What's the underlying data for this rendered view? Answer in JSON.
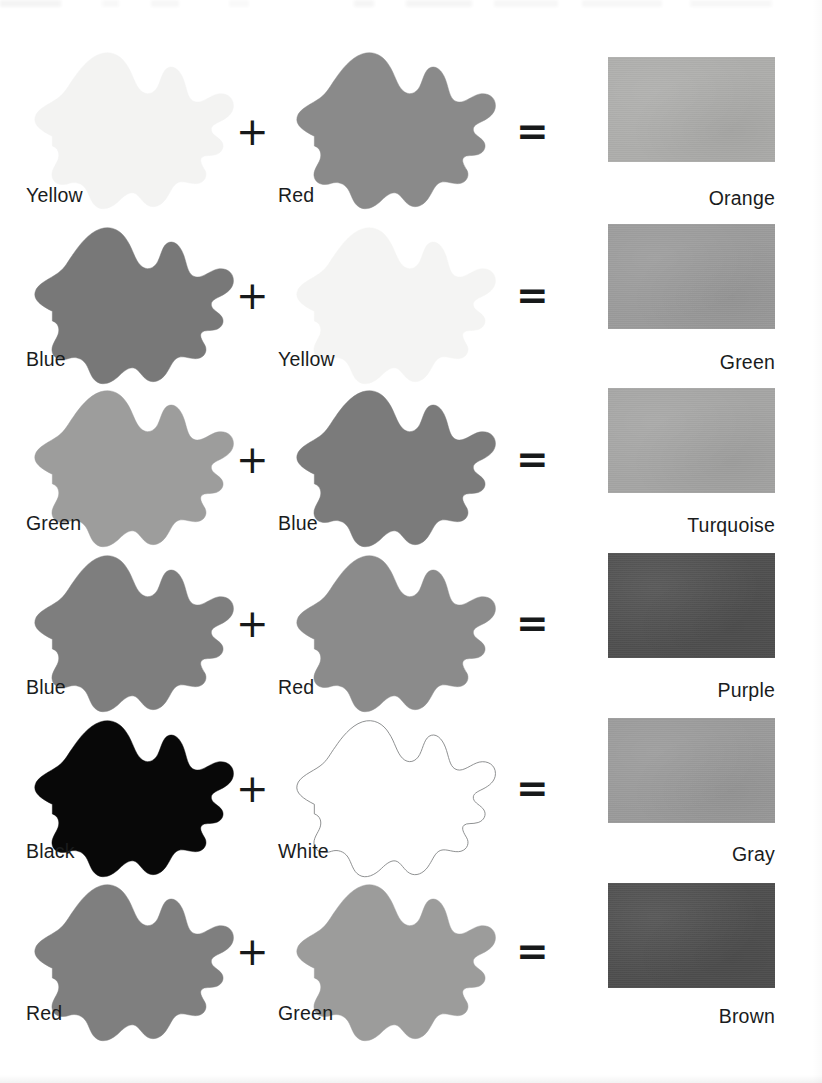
{
  "document": {
    "title": "Color Mixing Chart",
    "operators": {
      "plus": "+",
      "equals": "="
    },
    "swatch_texture_note": "grayscale scan"
  },
  "rows": [
    {
      "id": "row-orange",
      "ingredient_a": {
        "label": "Yellow",
        "swatch_color": "#f3f3f2"
      },
      "ingredient_b": {
        "label": "Red",
        "swatch_color": "#8a8a8a"
      },
      "result": {
        "label": "Orange",
        "swatch_color": "#adadab"
      }
    },
    {
      "id": "row-green",
      "ingredient_a": {
        "label": "Blue",
        "swatch_color": "#787878"
      },
      "ingredient_b": {
        "label": "Yellow",
        "swatch_color": "#f4f4f3"
      },
      "result": {
        "label": "Green",
        "swatch_color": "#9b9b9b"
      }
    },
    {
      "id": "row-turquoise",
      "ingredient_a": {
        "label": "Green",
        "swatch_color": "#9d9d9c"
      },
      "ingredient_b": {
        "label": "Blue",
        "swatch_color": "#7b7b7b"
      },
      "result": {
        "label": "Turquoise",
        "swatch_color": "#a5a5a4"
      }
    },
    {
      "id": "row-purple",
      "ingredient_a": {
        "label": "Blue",
        "swatch_color": "#7e7e7e"
      },
      "ingredient_b": {
        "label": "Red",
        "swatch_color": "#8b8b8b"
      },
      "result": {
        "label": "Purple",
        "swatch_color": "#4f4f4f"
      }
    },
    {
      "id": "row-gray",
      "ingredient_a": {
        "label": "Black",
        "swatch_color": "#080808"
      },
      "ingredient_b": {
        "label": "White",
        "swatch_color": "#ffffff"
      },
      "result": {
        "label": "Gray",
        "swatch_color": "#9a9a9a"
      }
    },
    {
      "id": "row-brown",
      "ingredient_a": {
        "label": "Red",
        "swatch_color": "#7f7f7f"
      },
      "ingredient_b": {
        "label": "Green",
        "swatch_color": "#9c9c9b"
      },
      "result": {
        "label": "Brown",
        "swatch_color": "#4e4e4e"
      }
    }
  ]
}
